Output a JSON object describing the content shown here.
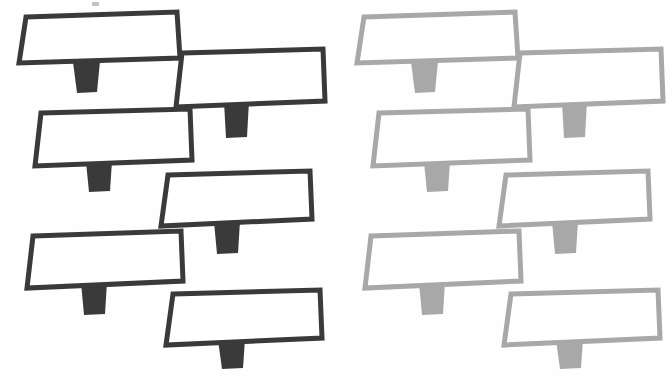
{
  "figure": {
    "title": "Two groups of signpost shapes",
    "description": "Twelve identical billboard/signpost outlines arranged in two staggered columns of six; left group rendered in dark charcoal, right group in light gray.",
    "canvas": {
      "width": 669,
      "height": 379
    },
    "background_color": "#fefefe"
  },
  "groups": [
    {
      "id": "left-group",
      "name": "dark-signposts",
      "label": "Left group (high contrast)",
      "stroke_color": "#3a3a3a",
      "fill_color": "#ffffff",
      "post_color": "#3a3a3a",
      "stroke_width": 5,
      "count": 6,
      "shapes": [
        {
          "id": "dark-sign-1",
          "label": "Sign 1",
          "board": [
            [
              26,
              17
            ],
            [
              177,
              12
            ],
            [
              180,
              58
            ],
            [
              19,
              63
            ]
          ],
          "post": [
            [
              73,
              62
            ],
            [
              100,
              61
            ],
            [
              97,
              92
            ],
            [
              77,
              93
            ]
          ]
        },
        {
          "id": "dark-sign-2",
          "label": "Sign 2",
          "board": [
            [
              182,
              53
            ],
            [
              323,
              49
            ],
            [
              325,
              101
            ],
            [
              176,
              107
            ]
          ],
          "post": [
            [
              224,
              102
            ],
            [
              249,
              101
            ],
            [
              247,
              137
            ],
            [
              226,
              138
            ]
          ]
        },
        {
          "id": "dark-sign-3",
          "label": "Sign 3",
          "board": [
            [
              41,
              113
            ],
            [
              190,
              109
            ],
            [
              192,
              160
            ],
            [
              35,
              166
            ]
          ],
          "post": [
            [
              86,
              162
            ],
            [
              112,
              161
            ],
            [
              110,
              191
            ],
            [
              89,
              192
            ]
          ]
        },
        {
          "id": "dark-sign-4",
          "label": "Sign 4",
          "board": [
            [
              168,
              175
            ],
            [
              310,
              171
            ],
            [
              312,
              219
            ],
            [
              161,
              226
            ]
          ],
          "post": [
            [
              214,
              222
            ],
            [
              240,
              221
            ],
            [
              238,
              253
            ],
            [
              217,
              254
            ]
          ]
        },
        {
          "id": "dark-sign-5",
          "label": "Sign 5",
          "board": [
            [
              33,
              236
            ],
            [
              181,
              231
            ],
            [
              183,
              281
            ],
            [
              27,
              288
            ]
          ],
          "post": [
            [
              81,
              283
            ],
            [
              107,
              282
            ],
            [
              105,
              314
            ],
            [
              84,
              315
            ]
          ]
        },
        {
          "id": "dark-sign-6",
          "label": "Sign 6",
          "board": [
            [
              173,
              294
            ],
            [
              320,
              290
            ],
            [
              322,
              338
            ],
            [
              166,
              345
            ]
          ],
          "post": [
            [
              218,
              340
            ],
            [
              245,
              339
            ],
            [
              243,
              368
            ],
            [
              222,
              369
            ]
          ]
        }
      ]
    },
    {
      "id": "right-group",
      "name": "light-signposts",
      "label": "Right group (low contrast)",
      "stroke_color": "#a8a8a8",
      "fill_color": "#ffffff",
      "post_color": "#a8a8a8",
      "stroke_width": 5,
      "count": 6,
      "shapes": [
        {
          "id": "light-sign-1",
          "label": "Sign 1",
          "board": [
            [
              364,
              17
            ],
            [
              515,
              12
            ],
            [
              518,
              58
            ],
            [
              357,
              63
            ]
          ],
          "post": [
            [
              411,
              62
            ],
            [
              438,
              61
            ],
            [
              435,
              92
            ],
            [
              415,
              93
            ]
          ]
        },
        {
          "id": "light-sign-2",
          "label": "Sign 2",
          "board": [
            [
              520,
              53
            ],
            [
              661,
              49
            ],
            [
              663,
              101
            ],
            [
              514,
              107
            ]
          ],
          "post": [
            [
              562,
              102
            ],
            [
              587,
              101
            ],
            [
              585,
              137
            ],
            [
              564,
              138
            ]
          ]
        },
        {
          "id": "light-sign-3",
          "label": "Sign 3",
          "board": [
            [
              379,
              113
            ],
            [
              528,
              109
            ],
            [
              530,
              160
            ],
            [
              373,
              166
            ]
          ],
          "post": [
            [
              424,
              162
            ],
            [
              450,
              161
            ],
            [
              448,
              191
            ],
            [
              427,
              192
            ]
          ]
        },
        {
          "id": "light-sign-4",
          "label": "Sign 4",
          "board": [
            [
              506,
              175
            ],
            [
              648,
              171
            ],
            [
              650,
              219
            ],
            [
              499,
              226
            ]
          ],
          "post": [
            [
              552,
              222
            ],
            [
              578,
              221
            ],
            [
              576,
              253
            ],
            [
              555,
              254
            ]
          ]
        },
        {
          "id": "light-sign-5",
          "label": "Sign 5",
          "board": [
            [
              371,
              236
            ],
            [
              519,
              231
            ],
            [
              521,
              281
            ],
            [
              365,
              288
            ]
          ],
          "post": [
            [
              419,
              283
            ],
            [
              445,
              282
            ],
            [
              443,
              314
            ],
            [
              422,
              315
            ]
          ]
        },
        {
          "id": "light-sign-6",
          "label": "Sign 6",
          "board": [
            [
              511,
              294
            ],
            [
              658,
              290
            ],
            [
              660,
              338
            ],
            [
              504,
              345
            ]
          ],
          "post": [
            [
              556,
              340
            ],
            [
              583,
              339
            ],
            [
              581,
              368
            ],
            [
              560,
              369
            ]
          ]
        }
      ]
    }
  ],
  "artifacts": [
    {
      "id": "scan-speck",
      "label": "scan speck",
      "x": 92,
      "y": 2,
      "width": 7,
      "height": 4
    }
  ]
}
